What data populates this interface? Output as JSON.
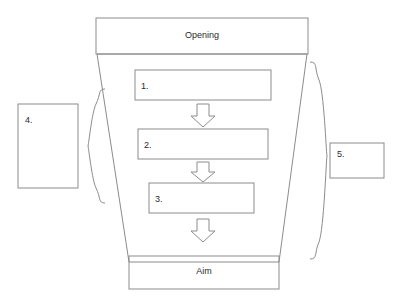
{
  "diagram": {
    "title_box": {
      "label": "Opening"
    },
    "bottom_box": {
      "label": "Aim"
    },
    "steps": [
      {
        "id": "step-1",
        "label": "1."
      },
      {
        "id": "step-2",
        "label": "2."
      },
      {
        "id": "step-3",
        "label": "3."
      }
    ],
    "side_boxes": [
      {
        "id": "left-box",
        "label": "4."
      },
      {
        "id": "right-box",
        "label": "5."
      }
    ],
    "arrows": [
      {
        "id": "arrow-1",
        "direction": "down"
      },
      {
        "id": "arrow-2",
        "direction": "down"
      },
      {
        "id": "arrow-3",
        "direction": "down"
      }
    ],
    "braces": [
      {
        "id": "left-brace",
        "orientation": "left"
      },
      {
        "id": "right-brace",
        "orientation": "right"
      }
    ],
    "colors": {
      "stroke": "#8c8c8c",
      "text": "#2b2b2b",
      "background": "#ffffff"
    }
  }
}
